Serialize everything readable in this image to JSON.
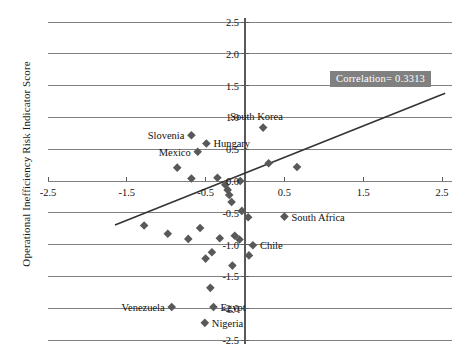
{
  "chart_data": {
    "type": "scatter",
    "title": "",
    "xlabel": "",
    "ylabel": "Operational Inefficiency Risk Indicator Score",
    "xlim": [
      -2.5,
      2.5
    ],
    "ylim": [
      -2.5,
      2.5
    ],
    "grid": true,
    "grid_axis": "y",
    "legend": "none",
    "annotation": "Correlation= 0.3313",
    "correlation": 0.3313,
    "xticks": [
      "-2.5",
      "-1.5",
      "-0.5",
      "0.5",
      "1.5",
      "2.5"
    ],
    "xtick_values": [
      -2.5,
      -1.5,
      -0.5,
      0.5,
      1.5,
      2.5
    ],
    "yticks": [
      "2.5",
      "2.0",
      "1.5",
      "1.0",
      "0.5",
      "0.0",
      "-0.5",
      "-1.0",
      "-1.5",
      "-2.0",
      "-2.5"
    ],
    "ytick_values": [
      2.5,
      2.0,
      1.5,
      1.0,
      0.5,
      0.0,
      -0.5,
      -1.0,
      -1.5,
      -2.0,
      -2.5
    ],
    "trendline": {
      "x_start": -1.65,
      "y_start": -0.69,
      "x_end": 2.54,
      "y_end": 1.38
    },
    "points": [
      {
        "label": "Slovenia",
        "x": -0.68,
        "y": 0.72,
        "label_pos": "left"
      },
      {
        "label": "Hungary",
        "x": -0.49,
        "y": 0.59,
        "label_pos": "right"
      },
      {
        "label": "Mexico",
        "x": -0.6,
        "y": 0.46,
        "label_pos": "left"
      },
      {
        "label": "South Korea",
        "x": 0.23,
        "y": 0.84,
        "label_pos": "above"
      },
      {
        "label": "South Africa",
        "x": 0.5,
        "y": -0.56,
        "label_pos": "right"
      },
      {
        "label": "Chile",
        "x": 0.1,
        "y": -1.01,
        "label_pos": "right"
      },
      {
        "label": "Venezuela",
        "x": -0.93,
        "y": -1.98,
        "label_pos": "left"
      },
      {
        "label": "Egypt",
        "x": -0.4,
        "y": -1.98,
        "label_pos": "right"
      },
      {
        "label": "Nigeria",
        "x": -0.51,
        "y": -2.23,
        "label_pos": "right"
      },
      {
        "label": "",
        "x": -0.86,
        "y": 0.21,
        "label_pos": "none"
      },
      {
        "label": "",
        "x": -0.68,
        "y": 0.04,
        "label_pos": "none"
      },
      {
        "label": "",
        "x": -0.35,
        "y": 0.05,
        "label_pos": "none"
      },
      {
        "label": "",
        "x": -0.25,
        "y": -0.06,
        "label_pos": "none"
      },
      {
        "label": "",
        "x": -0.22,
        "y": -0.14,
        "label_pos": "none"
      },
      {
        "label": "",
        "x": -0.2,
        "y": -0.22,
        "label_pos": "none"
      },
      {
        "label": "",
        "x": -0.17,
        "y": -0.33,
        "label_pos": "none"
      },
      {
        "label": "",
        "x": -0.06,
        "y": 0.0,
        "label_pos": "none"
      },
      {
        "label": "",
        "x": 0.3,
        "y": 0.28,
        "label_pos": "none"
      },
      {
        "label": "",
        "x": 0.66,
        "y": 0.22,
        "label_pos": "none"
      },
      {
        "label": "",
        "x": -0.04,
        "y": -0.47,
        "label_pos": "none"
      },
      {
        "label": "",
        "x": 0.04,
        "y": -0.57,
        "label_pos": "none"
      },
      {
        "label": "",
        "x": 0.05,
        "y": -1.17,
        "label_pos": "none"
      },
      {
        "label": "",
        "x": -1.28,
        "y": -0.7,
        "label_pos": "none"
      },
      {
        "label": "",
        "x": -0.98,
        "y": -0.83,
        "label_pos": "none"
      },
      {
        "label": "",
        "x": -0.72,
        "y": -0.91,
        "label_pos": "none"
      },
      {
        "label": "",
        "x": -0.57,
        "y": -0.74,
        "label_pos": "none"
      },
      {
        "label": "",
        "x": -0.32,
        "y": -0.9,
        "label_pos": "none"
      },
      {
        "label": "",
        "x": -0.13,
        "y": -0.86,
        "label_pos": "none"
      },
      {
        "label": "",
        "x": -0.07,
        "y": -0.92,
        "label_pos": "none"
      },
      {
        "label": "",
        "x": -0.42,
        "y": -1.12,
        "label_pos": "none"
      },
      {
        "label": "",
        "x": -0.5,
        "y": -1.22,
        "label_pos": "none"
      },
      {
        "label": "",
        "x": -0.16,
        "y": -1.33,
        "label_pos": "none"
      },
      {
        "label": "",
        "x": -0.44,
        "y": -1.68,
        "label_pos": "none"
      }
    ]
  },
  "colors": {
    "marker": "#595959",
    "gridline": "#808080",
    "axis": "#595959",
    "trendline": "#333333",
    "annotation_bg": "#808080",
    "annotation_fg": "#ffffff",
    "text": "#111111"
  }
}
